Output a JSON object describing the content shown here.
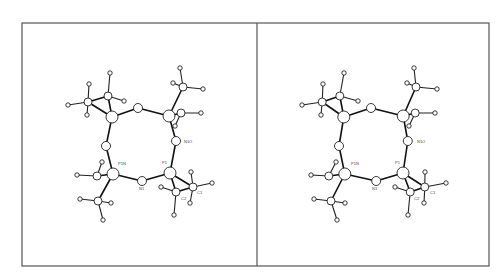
{
  "figure": {
    "type": "stereo-pair ORTEP molecular structure",
    "panels": 2,
    "frame": {
      "x": 22,
      "y": 23,
      "width": 467,
      "height": 243,
      "divider_x": 257
    },
    "offset_right": 233,
    "labels": [
      {
        "id": "P1N",
        "text": "P1N",
        "x": 118,
        "y": 165
      },
      {
        "id": "P1",
        "text": "P1",
        "x": 162,
        "y": 164
      },
      {
        "id": "N1",
        "text": "N1",
        "x": 139,
        "y": 190
      },
      {
        "id": "N1O",
        "text": "N1O",
        "x": 184,
        "y": 143
      },
      {
        "id": "C2",
        "text": "C2",
        "x": 181,
        "y": 200
      },
      {
        "id": "C1",
        "text": "C1",
        "x": 197,
        "y": 194
      }
    ],
    "atoms": [
      {
        "name": "Pa",
        "x": 112,
        "y": 117,
        "r": 6
      },
      {
        "name": "Oa",
        "x": 138,
        "y": 108,
        "r": 4.5
      },
      {
        "name": "Pb",
        "x": 169,
        "y": 116,
        "r": 6
      },
      {
        "name": "N1O",
        "x": 176,
        "y": 141,
        "r": 4.5
      },
      {
        "name": "P1",
        "x": 170,
        "y": 173,
        "r": 6
      },
      {
        "name": "N1",
        "x": 142,
        "y": 181,
        "r": 4.5
      },
      {
        "name": "P1N",
        "x": 113,
        "y": 174,
        "r": 6
      },
      {
        "name": "Nb",
        "x": 106,
        "y": 146,
        "r": 4.5
      },
      {
        "name": "Ca1",
        "x": 88,
        "y": 102,
        "r": 4
      },
      {
        "name": "Ca2",
        "x": 108,
        "y": 96,
        "r": 4
      },
      {
        "name": "Cb1",
        "x": 183,
        "y": 87,
        "r": 4
      },
      {
        "name": "Cb2",
        "x": 181,
        "y": 113,
        "r": 4
      },
      {
        "name": "Cc1",
        "x": 97,
        "y": 176,
        "r": 4
      },
      {
        "name": "Cc2",
        "x": 98,
        "y": 201,
        "r": 4
      },
      {
        "name": "C2",
        "x": 176,
        "y": 192,
        "r": 4
      },
      {
        "name": "C1",
        "x": 193,
        "y": 187,
        "r": 4
      }
    ],
    "bonds": [
      [
        "Pa",
        "Oa"
      ],
      [
        "Oa",
        "Pb"
      ],
      [
        "Pb",
        "N1O"
      ],
      [
        "N1O",
        "P1"
      ],
      [
        "P1",
        "N1"
      ],
      [
        "N1",
        "P1N"
      ],
      [
        "P1N",
        "Nb"
      ],
      [
        "Nb",
        "Pa"
      ],
      [
        "Pa",
        "Ca1"
      ],
      [
        "Pa",
        "Ca2"
      ],
      [
        "Ca1",
        "Ca2"
      ],
      [
        "Pb",
        "Cb1"
      ],
      [
        "Pb",
        "Cb2"
      ],
      [
        "P1N",
        "Cc1"
      ],
      [
        "P1N",
        "Cc2"
      ],
      [
        "P1",
        "C2"
      ],
      [
        "P1",
        "C1"
      ],
      [
        "C2",
        "C1"
      ]
    ],
    "hydrogens": [
      {
        "x": 68,
        "y": 105,
        "to": "Ca1"
      },
      {
        "x": 89,
        "y": 84,
        "to": "Ca1"
      },
      {
        "x": 87,
        "y": 115,
        "to": "Ca1"
      },
      {
        "x": 110,
        "y": 73,
        "to": "Ca2"
      },
      {
        "x": 124,
        "y": 101,
        "to": "Ca2"
      },
      {
        "x": 180,
        "y": 68,
        "to": "Cb1"
      },
      {
        "x": 173,
        "y": 83,
        "to": "Cb1"
      },
      {
        "x": 203,
        "y": 89,
        "to": "Cb1"
      },
      {
        "x": 201,
        "y": 113,
        "to": "Cb2"
      },
      {
        "x": 175,
        "y": 126,
        "to": "Cb2"
      },
      {
        "x": 77,
        "y": 175,
        "to": "Cc1"
      },
      {
        "x": 102,
        "y": 162,
        "to": "Cc1"
      },
      {
        "x": 80,
        "y": 199,
        "to": "Cc2"
      },
      {
        "x": 111,
        "y": 203,
        "to": "Cc2"
      },
      {
        "x": 103,
        "y": 220,
        "to": "Cc2"
      },
      {
        "x": 161,
        "y": 187,
        "to": "C2"
      },
      {
        "x": 174,
        "y": 215,
        "to": "C2"
      },
      {
        "x": 191,
        "y": 172,
        "to": "C1"
      },
      {
        "x": 212,
        "y": 183,
        "to": "C1"
      },
      {
        "x": 190,
        "y": 203,
        "to": "C1"
      }
    ]
  }
}
